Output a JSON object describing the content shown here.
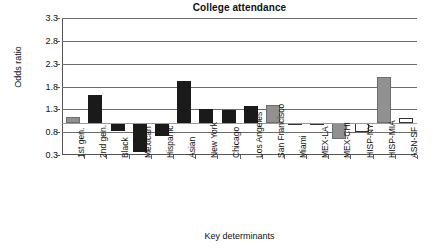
{
  "chart_data": {
    "type": "bar",
    "title": "College attendance",
    "xlabel": "Key determinants",
    "ylabel": "Odds ratio",
    "ylim": [
      0.3,
      3.3
    ],
    "yticks": [
      0.3,
      0.8,
      1.3,
      1.8,
      2.3,
      2.8,
      3.3
    ],
    "ytick_labels": [
      "0.3",
      "0.8",
      "1.3",
      "1.8",
      "2.3",
      "2.8",
      "3.3"
    ],
    "grid": "horizontal",
    "legend": "none",
    "baseline": 1.0,
    "categories": [
      "1st gen.",
      "2nd gen.",
      "Black",
      "Mexican",
      "Hispanic",
      "Asian",
      "New York",
      "Chicago",
      "Los Angeles",
      "San Francisco",
      "Miami",
      "MEX-LA",
      "MEX-CHI",
      "HISP-NY",
      "HISP-MIA",
      "ASN-SF"
    ],
    "values": [
      1.13,
      1.61,
      0.83,
      0.36,
      0.72,
      1.93,
      1.31,
      1.28,
      1.37,
      1.4,
      0.97,
      0.96,
      0.64,
      0.81,
      2.01,
      1.1
    ],
    "fills": [
      "gray",
      "black",
      "black",
      "black",
      "black",
      "black",
      "black",
      "black",
      "black",
      "gray",
      "white",
      "white",
      "gray",
      "white",
      "gray",
      "white"
    ],
    "colors": {
      "black": "#1a1a1a",
      "gray": "#919191",
      "white": "#ffffff",
      "outline": "#333333",
      "gridline": "#6b6b6b",
      "axis": "#555555",
      "text": "#111111"
    }
  }
}
